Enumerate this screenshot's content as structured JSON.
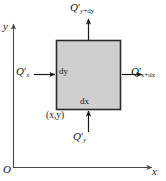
{
  "figure": {
    "colors": {
      "element_fill": "#cfcfcf",
      "element_stroke": "#2b2b2b",
      "axis": "#4a4a4a",
      "arrow": "#1a1a1a",
      "text": "#1a1a1a",
      "background": "#ffffff"
    },
    "axes": {
      "y_label": "y",
      "x_label": "x",
      "origin_label": "O"
    },
    "element": {
      "fill_label": "control-volume",
      "width_label": "dx",
      "height_label": "dy",
      "corner_label": "(x,y)"
    },
    "fluxes": [
      {
        "name": "flux-left-in",
        "symbol": "Q",
        "prime": "′",
        "subscript": "x",
        "full": "Q′x",
        "direction": "right",
        "side": "left"
      },
      {
        "name": "flux-right-out",
        "symbol": "Q",
        "prime": "′",
        "subscript": "x+dx",
        "full": "Q′x+dx",
        "direction": "right",
        "side": "right"
      },
      {
        "name": "flux-bottom-in",
        "symbol": "Q",
        "prime": "′",
        "subscript": "y",
        "full": "Q′y",
        "direction": "up",
        "side": "bottom"
      },
      {
        "name": "flux-top-out",
        "symbol": "Q",
        "prime": "′",
        "subscript": "y+dy",
        "full": "Q′y+dy",
        "direction": "up",
        "side": "top"
      }
    ]
  }
}
